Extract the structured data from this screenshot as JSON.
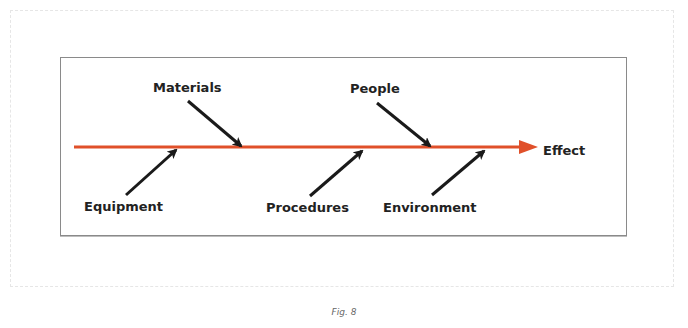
{
  "diagram": {
    "type": "fishbone (Ishikawa) cause-and-effect diagram",
    "effect": "Effect",
    "causes_top": [
      "Materials",
      "People"
    ],
    "causes_bottom": [
      "Equipment",
      "Procedures",
      "Environment"
    ],
    "spine_color": "#e0502a",
    "arrow_color": "#1a1a1a"
  },
  "labels": {
    "materials": "Materials",
    "people": "People",
    "equipment": "Equipment",
    "procedures": "Procedures",
    "environment": "Environment",
    "effect": "Effect"
  },
  "caption": "Fig. 8"
}
